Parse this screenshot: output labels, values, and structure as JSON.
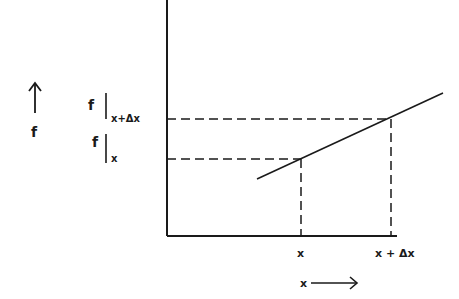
{
  "diagram": {
    "y_axis_label": "f",
    "x_axis_label": "x",
    "f_at_x_label": "f",
    "f_at_x_subscript": "x",
    "f_at_xdx_label": "f",
    "f_at_xdx_subscript": "x+Δx",
    "x_tick_1": "x",
    "x_tick_2": "x + Δx",
    "line_color": "#1a1a1a"
  }
}
